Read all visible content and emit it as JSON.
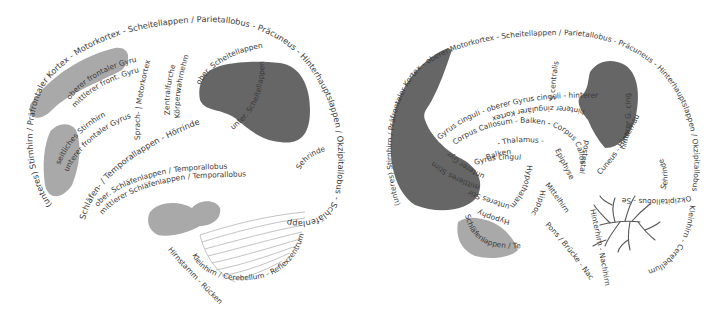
{
  "diagram": {
    "type": "brain-anatomy-textpath",
    "language": "de",
    "colors": {
      "background": "#ffffff",
      "text": "#3a3a3a",
      "region_dark": "#666666",
      "region_light": "#a9a9a9",
      "cerebellum_hatch": "#9a9a9a"
    },
    "lateral_view": {
      "outer_contour": "(unteres) Stirnhirn / Präfrontaler Kortex - Motorkortex - Scheitellappen / Parietallobus - Präcuneus - Hinterhauptslappen / Okzipitallobus - Schläfenlappen / Temporallobus - temporaler Pol",
      "superior_frontal": "oberer frontaler Gyrus",
      "middle_frontal": "mittlerer front. Gyrus",
      "lateral_frontal": "seitliches Stirnhirn",
      "inferior_frontal": "unterer frontaler Gyrus",
      "motor_cortex": "Sprach- | Motorkortex",
      "central_sulcus": "Zentralfurche",
      "somatosensory": "Körperwahrnehmung",
      "temporal_upper": "Schläfen- / Temporallappen - Hörrinde",
      "parietal_upper": "ober. Scheitellappen",
      "parietal_lower": "unter. Scheitellappen",
      "superior_temporal": "ober. Schläfenlappen / Temporallobus",
      "middle_temporal": "mittlerer Schläfenlappen / Temporallobus",
      "visual_cortex": "Sehrinde",
      "cerebellum": "Kleinhirn / Cerebellum - Reflexzentrum",
      "brainstem": "Hirnstamm - Rückenmark"
    },
    "medial_view": {
      "outer_contour": "(unteres) Stirnhirn / Präfrontaler Kortex - oberer Motorkortex - Scheitellappen / Parietallobus - Präcuneus - Hinterhauptslappen / Okzipitallobus",
      "central_sulcus": "S.centralis",
      "cingulate_upper": "Gyrus cinguli - oberer Gyrus cinguli - hinterer Gyrus cinguli",
      "cingulate_posterior": "hinterer G. cinguli",
      "cingulate_inner": "hinterer zingulärer Kortex",
      "corpus_callosum": "Corpus Callosum - Balken - Corpus Callosum",
      "thalamus": "- Thalamus -",
      "epiphyse": "Epiphyse",
      "midbrain": "Mittelhirn",
      "tectum": "postestal",
      "cuneus": "Cuneus - Hinterhauptslappen",
      "frontal_medial": "mittleres Stirnhirn",
      "orbital": "unterer Gyrus",
      "septum": "unteres Stirnhirn",
      "fornix": "Balken",
      "cingulate_lower": "Gyrus cinguli",
      "hypothalamus": "Hypothalamus",
      "hypophysis": "Hypophyse",
      "hippocampus": "Hippocampus",
      "temporal": "Schläfenlappen / Temporallobus",
      "pons": "Pons / Brücke - Nachhirn",
      "metencephalon": "Hinterhirn - Nachhirn",
      "visual": "Sehrinde",
      "occipital_sub": "Okzipitallobus - Sehrinde",
      "cerebellum": "Kleinhirn - Cerebellum"
    }
  }
}
